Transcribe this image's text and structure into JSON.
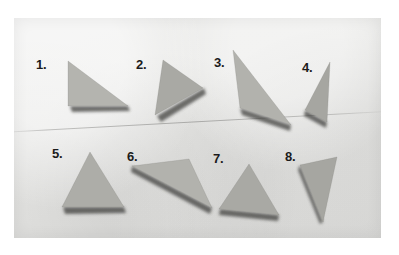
{
  "image": {
    "kind": "photograph",
    "subject": "eight cut paper triangles arranged in two rows on a light gray surface",
    "width": 399,
    "height": 255,
    "border_color": "#ffffff",
    "photo_background_color": "#e9e9e7",
    "photo_rect": {
      "x": 14,
      "y": 18,
      "width": 367,
      "height": 220
    },
    "crease_note": "faint diagonal scratch line across the middle of the print"
  },
  "palette": {
    "triangle_fill_light": "#b9b9b4",
    "triangle_fill_mid": "#a9a9a4",
    "triangle_fill_dark": "#9b9b96",
    "shadow_color": "#3a3a38",
    "label_color": "#1b1b1b"
  },
  "labels": [
    {
      "text": "1.",
      "x": 36,
      "y": 58
    },
    {
      "text": "2.",
      "x": 136,
      "y": 58
    },
    {
      "text": "3.",
      "x": 214,
      "y": 56
    },
    {
      "text": "4.",
      "x": 302,
      "y": 61
    },
    {
      "text": "5.",
      "x": 52,
      "y": 147
    },
    {
      "text": "6.",
      "x": 127,
      "y": 150
    },
    {
      "text": "7.",
      "x": 213,
      "y": 152
    },
    {
      "text": "8.",
      "x": 285,
      "y": 150
    }
  ],
  "triangles": [
    {
      "id": 1,
      "name": "triangle-1",
      "description": "right triangle, vertical left edge, horizontal bottom edge, hypotenuse from top-left down to bottom-right",
      "points": "54,43 54,88 114,88",
      "fill": "#b4b4af",
      "shadow_points": "56,88 114,88 116,93 58,94",
      "highlight_edge": "54,43 54,88"
    },
    {
      "id": 2,
      "name": "triangle-2",
      "description": "triangle pointing right, apex at right, long left edge leaning",
      "points": "149,42 141,97 189,70",
      "fill": "#a9a9a4",
      "shadow_points": "143,98 190,70 192,76 147,104",
      "highlight_edge": "149,42 141,97"
    },
    {
      "id": 3,
      "name": "triangle-3",
      "description": "thin sliver, apex at top, sweeping down to the right into a long point",
      "points": "219,32 226,90 277,107",
      "fill": "#b2b2ad",
      "shadow_points": "226,90 277,107 276,113 228,97",
      "highlight_edge": "219,32 226,90"
    },
    {
      "id": 4,
      "name": "triangle-4",
      "description": "narrow upright wedge, apex top-right, short base at bottom",
      "points": "316,44 291,92 313,104",
      "fill": "#a6a6a1",
      "shadow_points": "291,92 313,104 312,110 290,98",
      "highlight_edge": "316,44 291,92"
    },
    {
      "id": 5,
      "name": "triangle-5",
      "description": "upward pointing near-equilateral triangle resting on a flat base",
      "points": "76,134 48,189 110,189",
      "fill": "#adada8",
      "shadow_points": "49,189 110,189 112,195 51,196",
      "highlight_edge": "76,134 48,189"
    },
    {
      "id": 6,
      "name": "triangle-6",
      "description": "triangle pointing down-right, long upper-left to lower-right edge",
      "points": "118,148 175,141 198,190",
      "fill": "#b2b2ad",
      "shadow_points": "118,148 198,190 196,196 117,154",
      "highlight_edge": "175,141 198,190"
    },
    {
      "id": 7,
      "name": "triangle-7",
      "description": "tilted triangle, apex top-center, sloping down to the right",
      "points": "235,146 205,191 265,197",
      "fill": "#a9a9a4",
      "shadow_points": "206,191 265,197 264,203 205,197",
      "highlight_edge": "235,146 205,191"
    },
    {
      "id": 8,
      "name": "triangle-8",
      "description": "narrow wedge pointing down-right, wide top edge",
      "points": "286,147 323,139 309,204",
      "fill": "#a6a6a1",
      "shadow_points": "286,147 309,204 306,206 284,152",
      "highlight_edge": "323,139 309,204"
    }
  ]
}
